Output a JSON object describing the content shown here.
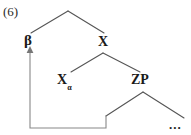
{
  "figure": {
    "example_number": "(6)",
    "background_color": "#ffffff",
    "line_color": "#4a4a4a",
    "text_color": "#1a1a1a"
  },
  "tree": {
    "nodes": [
      {
        "id": "root",
        "label": "",
        "x": 68,
        "y": 11
      },
      {
        "id": "beta",
        "label": "β",
        "x": 30,
        "y": 40
      },
      {
        "id": "x",
        "label": "X",
        "x": 103,
        "y": 42
      },
      {
        "id": "xalpha",
        "label": "X",
        "subscript": "α",
        "x": 70,
        "y": 80
      },
      {
        "id": "zp",
        "label": "ZP",
        "x": 143,
        "y": 80
      },
      {
        "id": "dots",
        "label": "...",
        "x": 176,
        "y": 124
      }
    ],
    "branches": [
      {
        "from": "root",
        "to": "beta"
      },
      {
        "from": "root",
        "to": "x"
      },
      {
        "from": "x",
        "to": "xalpha"
      },
      {
        "from": "x",
        "to": "zp"
      },
      {
        "from": "zp",
        "to": "zp-left-daughter"
      },
      {
        "from": "zp",
        "to": "dots"
      }
    ],
    "movement_arrow": {
      "from": "zp-left-daughter",
      "to": "beta",
      "arrowhead": "up"
    }
  }
}
